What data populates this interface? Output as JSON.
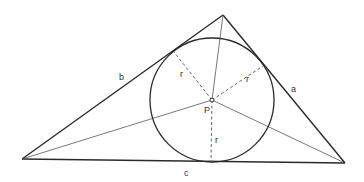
{
  "figure": {
    "vertices": {
      "top": [
        223,
        15
      ],
      "left": [
        22,
        159
      ],
      "right": [
        345,
        163
      ]
    },
    "incenter": {
      "label": "P",
      "point": [
        212,
        100
      ]
    },
    "incircle": {
      "center": [
        212,
        100
      ],
      "radius": 62
    },
    "tangent_points": {
      "on_b": [
        174,
        52
      ],
      "on_a": [
        263,
        66
      ],
      "on_c": [
        211,
        162
      ]
    },
    "side_labels": {
      "a": "a",
      "b": "b",
      "c": "c"
    },
    "radius_label": "r",
    "labels": {
      "side_a": "a",
      "side_b": "b",
      "side_c": "c",
      "r1": "r",
      "r2": "r",
      "r3": "r",
      "center": "P"
    },
    "colors": {
      "stroke": "#2a2a2a",
      "background": "#ffffff"
    }
  }
}
